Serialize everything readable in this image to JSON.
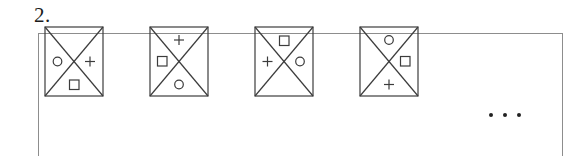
{
  "document": {
    "type": "worksheet-figure-sequence-question",
    "item_number": "2.",
    "ellipsis_label": "...",
    "ellipsis_dot_count": 3,
    "colors": {
      "ink": "#1a1a1a",
      "box_border": "#8d8d8d",
      "figure_stroke": "#3c3c3c",
      "page_background": "#ffffff"
    }
  },
  "answer_box": {
    "label": "answer-box",
    "border_color": "#8d8d8d"
  },
  "sequence": {
    "description": "Four squares with X diagonals; circle, plus and square symbols rotate clockwise through the triangular regions.",
    "symbol_names": {
      "circle": "circle-symbol",
      "plus": "plus-symbol",
      "square": "square-symbol",
      "empty": "empty-region"
    },
    "figures": [
      {
        "index": 1,
        "name": "figure-1",
        "top": "empty",
        "right": "plus",
        "bottom": "square",
        "left": "circle"
      },
      {
        "index": 2,
        "name": "figure-2",
        "top": "plus",
        "right": "empty",
        "bottom": "circle",
        "left": "square"
      },
      {
        "index": 3,
        "name": "figure-3",
        "top": "square",
        "right": "circle",
        "bottom": "empty",
        "left": "plus"
      },
      {
        "index": 4,
        "name": "figure-4",
        "top": "circle",
        "right": "square",
        "bottom": "plus",
        "left": "empty"
      }
    ]
  }
}
